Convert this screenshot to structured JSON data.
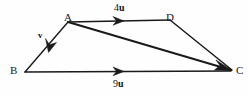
{
  "figure": {
    "type": "vector-diagram",
    "background_color": "#fefefe",
    "stroke_color": "#1a1a1a",
    "vertices": [
      {
        "id": "A",
        "label": "A",
        "x": 68,
        "y": 22
      },
      {
        "id": "D",
        "label": "D",
        "x": 170,
        "y": 20
      },
      {
        "id": "B",
        "label": "B",
        "x": 25,
        "y": 72
      },
      {
        "id": "C",
        "label": "C",
        "x": 233,
        "y": 71
      }
    ],
    "edges": [
      {
        "id": "AD",
        "from": "A",
        "to": "D",
        "arrow": "mid-forward",
        "width": 1.4
      },
      {
        "id": "AB",
        "from": "A",
        "to": "B",
        "arrow": "mid-forward",
        "width": 1.4
      },
      {
        "id": "AC",
        "from": "A",
        "to": "C",
        "arrow": "end",
        "width": 2.0
      },
      {
        "id": "DC",
        "from": "D",
        "to": "C",
        "arrow": "none",
        "width": 1.4
      },
      {
        "id": "BC",
        "from": "B",
        "to": "C",
        "arrow": "mid-forward",
        "width": 1.4
      }
    ],
    "vector_labels": [
      {
        "id": "4u",
        "magnitude": "4",
        "direction": "u",
        "edge": "AD"
      },
      {
        "id": "9u",
        "magnitude": "9",
        "direction": "u",
        "edge": "BC"
      },
      {
        "id": "v",
        "magnitude": "",
        "direction": "v",
        "edge": "AB"
      }
    ]
  }
}
